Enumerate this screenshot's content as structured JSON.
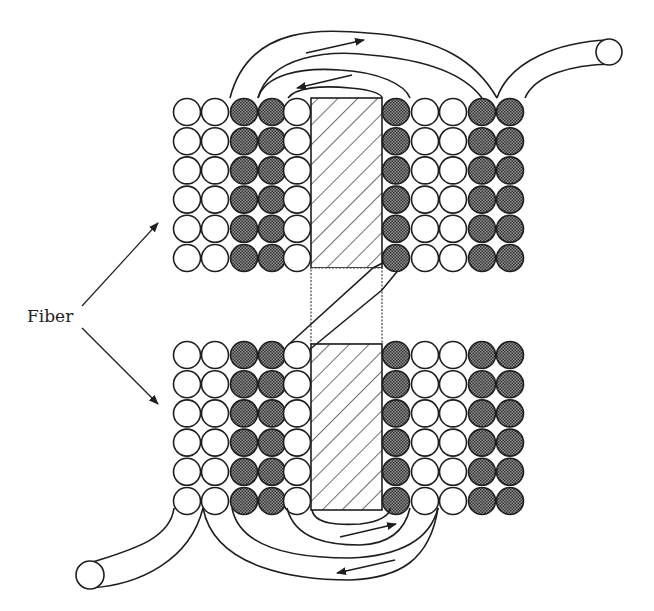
{
  "diagram": {
    "label": "Fiber",
    "colors": {
      "stroke": "#1e1e1e",
      "fiber_white": "#ffffff",
      "fiber_dark": "#6f6f6f",
      "background": "#ffffff"
    },
    "column_pattern_left": [
      "white",
      "white",
      "dark",
      "dark",
      "white"
    ],
    "column_pattern_right": [
      "dark",
      "white",
      "white",
      "dark",
      "dark"
    ],
    "rows_per_block": 6,
    "blocks": [
      "top",
      "bottom"
    ],
    "flow_arrows": [
      "top-outer-right",
      "top-inner-left",
      "bottom-inner-right",
      "bottom-outer-left"
    ]
  }
}
